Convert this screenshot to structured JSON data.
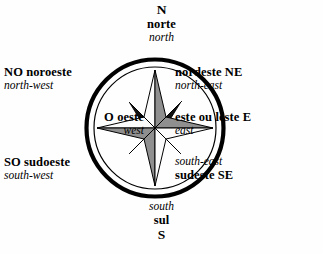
{
  "diagram": {
    "type": "compass-rose",
    "languages": [
      "Portuguese",
      "English"
    ],
    "colors": {
      "background": "#fefefe",
      "ink": "#000000",
      "ring": "#000000",
      "star_light": "#fbfbfb",
      "star_mid": "#8f8f8f",
      "star_dark": "#111111",
      "star_outline": "#000000"
    },
    "ring": {
      "center_x": 71,
      "center_y": 71,
      "outer_radius": 69,
      "outer_stroke": 4.2,
      "inner_radius": 61,
      "inner_stroke": 1.2
    },
    "star": {
      "points": 8,
      "cardinal_length": 58,
      "diagonal_length": 36,
      "cardinal_half_width": 11,
      "diagonal_half_width": 8
    }
  },
  "labels": {
    "north": {
      "abbr": "N",
      "native": "norte",
      "foreign": "north",
      "order": [
        "abbr",
        "native",
        "foreign"
      ],
      "align": "center"
    },
    "northwest": {
      "abbr": "NO",
      "native": "noroeste",
      "foreign": "north-west",
      "native_line": "NO  noroeste",
      "order": [
        "native_line",
        "foreign"
      ],
      "align": "left"
    },
    "west": {
      "abbr": "O",
      "native": "oeste",
      "foreign": "west",
      "native_line": "O  oeste",
      "order": [
        "native_line",
        "foreign"
      ],
      "align": "right"
    },
    "southwest": {
      "abbr": "SO",
      "native": "sudoeste",
      "foreign": "south-west",
      "native_line": "SO  sudoeste",
      "order": [
        "native_line",
        "foreign"
      ],
      "align": "left"
    },
    "northeast": {
      "abbr": "NE",
      "native": "nordeste",
      "foreign": "north-east",
      "native_line": "nordeste  NE",
      "order": [
        "native_line",
        "foreign"
      ],
      "align": "left"
    },
    "east": {
      "abbr": "E",
      "native": "este ou leste",
      "foreign": "east",
      "native_line": "este ou leste  E",
      "order": [
        "native_line",
        "foreign"
      ],
      "align": "left"
    },
    "southeast": {
      "abbr": "SE",
      "native": "sudeste",
      "foreign": "south-east",
      "native_line": "sudeste  SE",
      "order": [
        "foreign",
        "native_line"
      ],
      "align": "left"
    },
    "south": {
      "abbr": "S",
      "native": "sul",
      "foreign": "south",
      "order": [
        "foreign",
        "native",
        "abbr"
      ],
      "align": "center"
    }
  }
}
